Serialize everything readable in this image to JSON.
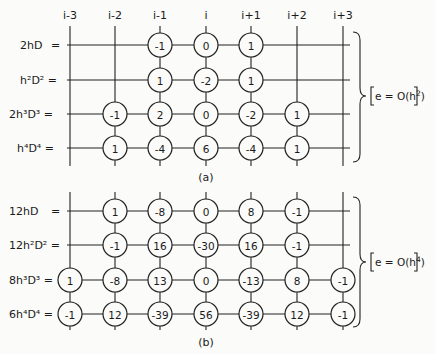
{
  "columns": [
    "i-3",
    "i-2",
    "i-1",
    "i",
    "i+1",
    "i+2",
    "i+3"
  ],
  "column_x": [
    70,
    115,
    160,
    206,
    251,
    297,
    343
  ],
  "panels": [
    {
      "caption": "(a)",
      "error": "e = O(h²)",
      "error_base": "e = O(h",
      "error_exp": "2",
      "rows": [
        {
          "label": "2hD",
          "label_parts": [
            "2hD",
            "",
            "",
            "="
          ],
          "y": 45,
          "values": [
            null,
            null,
            "-1",
            "0",
            "1",
            null,
            null
          ]
        },
        {
          "label": "h²D² =",
          "y": 80,
          "values": [
            null,
            null,
            "1",
            "-2",
            "1",
            null,
            null
          ]
        },
        {
          "label": "2h³D³ =",
          "y": 114,
          "values": [
            null,
            "-1",
            "2",
            "0",
            "-2",
            "1",
            null
          ]
        },
        {
          "label": "h⁴D⁴ =",
          "y": 148,
          "values": [
            null,
            "1",
            "-4",
            "6",
            "-4",
            "1",
            null
          ]
        }
      ]
    },
    {
      "caption": "(b)",
      "error": "e = O(h⁴)",
      "error_base": "e = O(h",
      "error_exp": "4",
      "rows": [
        {
          "label": "12hD",
          "y": 211,
          "values": [
            null,
            "1",
            "-8",
            "0",
            "8",
            "-1",
            null
          ]
        },
        {
          "label": "12h²D² =",
          "y": 245,
          "values": [
            null,
            "-1",
            "16",
            "-30",
            "16",
            "-1",
            null
          ]
        },
        {
          "label": "8h³D³ =",
          "y": 280,
          "values": [
            "1",
            "-8",
            "13",
            "0",
            "-13",
            "8",
            "-1"
          ]
        },
        {
          "label": "6h⁴D⁴ =",
          "y": 314,
          "values": [
            "-1",
            "12",
            "-39",
            "56",
            "-39",
            "12",
            "-1"
          ]
        }
      ]
    }
  ],
  "row_labels": {
    "a0": "2hD",
    "a0_eq": "=",
    "a1": "h²D² =",
    "a2": "2h³D³ =",
    "a3": "h⁴D⁴ =",
    "b0": "12hD",
    "b0_eq": "=",
    "b1": "12h²D² =",
    "b2": "8h³D³ =",
    "b3": "6h⁴D⁴ ="
  }
}
